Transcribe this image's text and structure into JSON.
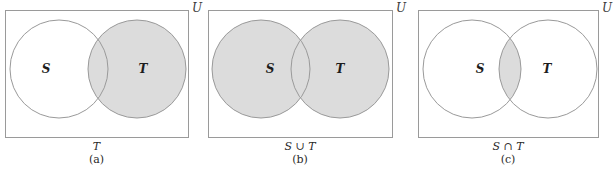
{
  "figure": {
    "kind": "venn-diagram-set-operations",
    "colors": {
      "stroke": "#9a9a9a",
      "shade_fill": "#dcdcdc",
      "background": "#ffffff",
      "text": "#1d1d1d"
    },
    "panels": [
      {
        "id": "a",
        "universe_label": "U",
        "left_circle_label": "S",
        "right_circle_label": "T",
        "caption_expression": "T",
        "caption_tag": "(a)",
        "shaded_region": "T only",
        "rect": {
          "x": 5,
          "y": 10,
          "w": 183,
          "h": 127
        },
        "left_circle": {
          "cx": 59,
          "cy": 69,
          "r": 49
        },
        "right_circle": {
          "cx": 137,
          "cy": 69,
          "r": 49
        },
        "left_label_pos": {
          "x": 46,
          "y": 69
        },
        "right_label_pos": {
          "x": 143,
          "y": 69
        },
        "shade_left": false,
        "shade_right": true,
        "shade_intersection_only": false
      },
      {
        "id": "b",
        "universe_label": "U",
        "left_circle_label": "S",
        "right_circle_label": "T",
        "caption_expression": "S ∪ T",
        "caption_tag": "(b)",
        "shaded_region": "S union T",
        "rect": {
          "x": 208,
          "y": 10,
          "w": 184,
          "h": 127
        },
        "left_circle": {
          "cx": 261,
          "cy": 69,
          "r": 49
        },
        "right_circle": {
          "cx": 340,
          "cy": 69,
          "r": 49
        },
        "left_label_pos": {
          "x": 270,
          "y": 69
        },
        "right_label_pos": {
          "x": 340,
          "y": 69
        },
        "shade_left": true,
        "shade_right": true,
        "shade_intersection_only": false
      },
      {
        "id": "c",
        "universe_label": "U",
        "left_circle_label": "S",
        "right_circle_label": "T",
        "caption_expression": "S ∩ T",
        "caption_tag": "(c)",
        "shaded_region": "S intersect T",
        "rect": {
          "x": 418,
          "y": 10,
          "w": 180,
          "h": 127
        },
        "left_circle": {
          "cx": 472,
          "cy": 69,
          "r": 49
        },
        "right_circle": {
          "cx": 548,
          "cy": 69,
          "r": 49
        },
        "left_label_pos": {
          "x": 480,
          "y": 69
        },
        "right_label_pos": {
          "x": 547,
          "y": 69
        },
        "shade_left": false,
        "shade_right": false,
        "shade_intersection_only": true
      }
    ]
  }
}
